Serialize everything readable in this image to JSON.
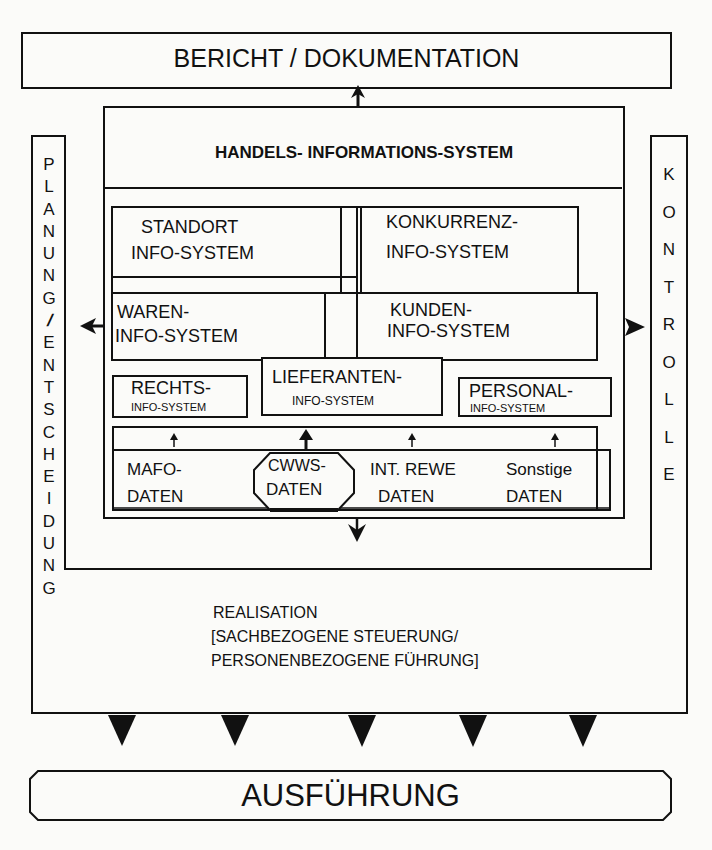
{
  "top_box": {
    "label": "BERICHT / DOKUMENTATION"
  },
  "his": {
    "title": "HANDELS- INFORMATIONS-SYSTEM",
    "modules": {
      "standort": {
        "line1": "STANDORT",
        "line2": "INFO-SYSTEM"
      },
      "konkurrenz": {
        "line1": "KONKURRENZ-",
        "line2": "INFO-SYSTEM"
      },
      "waren": {
        "line1": "WAREN-",
        "line2": "INFO-SYSTEM"
      },
      "kunden": {
        "line1": "KUNDEN-",
        "line2": "INFO-SYSTEM"
      },
      "rechts": {
        "line1": "RECHTS-",
        "line2": "INFO-SYSTEM"
      },
      "lieferanten": {
        "line1": "LIEFERANTEN-",
        "line2": "INFO-SYSTEM"
      },
      "personal": {
        "line1": "PERSONAL-",
        "line2": "INFO-SYSTEM"
      }
    },
    "data_sources": {
      "mafo": {
        "line1": "MAFO-",
        "line2": "DATEN"
      },
      "cwws": {
        "line1": "CWWS-",
        "line2": "DATEN"
      },
      "intrewe": {
        "line1": "INT. REWE",
        "line2": "DATEN"
      },
      "sonstige": {
        "line1": "Sonstige",
        "line2": "DATEN"
      }
    }
  },
  "left_column": {
    "label": "PLANUNG/ENTSCHEIDUNG",
    "letters": [
      "P",
      "L",
      "A",
      "N",
      "U",
      "N",
      "G",
      "/",
      "E",
      "N",
      "T",
      "S",
      "C",
      "H",
      "E",
      "I",
      "D",
      "U",
      "N",
      "G"
    ]
  },
  "right_column": {
    "label": "KONTROLLE",
    "letters": [
      "K",
      "O",
      "N",
      "T",
      "R",
      "O",
      "L",
      "L",
      "E"
    ]
  },
  "realisation": {
    "line1": "REALISATION",
    "line2": "[SACHBEZOGENE STEUERUNG/",
    "line3": "PERSONENBEZOGENE FÜHRUNG]"
  },
  "bottom_box": {
    "label": "AUSFÜHRUNG"
  },
  "colors": {
    "line": "#111111",
    "background": "#fbfbf9"
  }
}
